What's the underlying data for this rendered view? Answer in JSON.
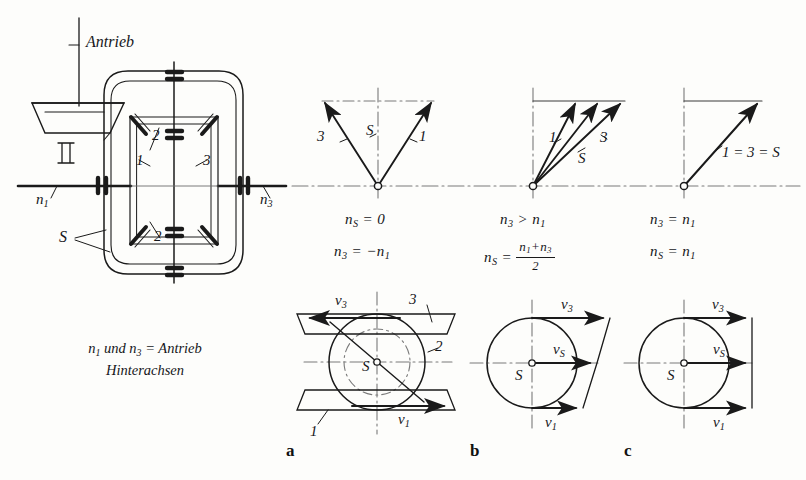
{
  "figure": {
    "type": "technical-diagram",
    "language": "de"
  },
  "mechanism": {
    "drive_label": "Antrieb",
    "input_shaft_speed_left": "n",
    "input_shaft_speed_left_sub": "1",
    "input_shaft_speed_right": "n",
    "input_shaft_speed_right_sub": "3",
    "cage_label": "S",
    "gear_labels": [
      "1",
      "2",
      "3",
      "2"
    ],
    "caption_line1_a": "n",
    "caption_line1_a_sub": "1",
    "caption_line1_b": "und",
    "caption_line1_c": "n",
    "caption_line1_c_sub": "3",
    "caption_line1_d": "= Antrieb",
    "caption_line2": "Hinterachsen"
  },
  "speed_diagrams": [
    {
      "id": "left",
      "vector_labels": [
        "3",
        "S",
        "1"
      ],
      "eq1_lhs": "n",
      "eq1_lhs_sub": "S",
      "eq1_rel": "=",
      "eq1_rhs": "0",
      "eq2_lhs": "n",
      "eq2_lhs_sub": "3",
      "eq2_rel": "=",
      "eq2_rhs": "−n",
      "eq2_rhs_sub": "1",
      "description": "Cage stationary, wheels counter-rotate"
    },
    {
      "id": "middle",
      "vector_labels": [
        "1",
        "S",
        "3"
      ],
      "eq1_lhs": "n",
      "eq1_lhs_sub": "3",
      "eq1_rel": ">",
      "eq1_rhs": "n",
      "eq1_rhs_sub": "1",
      "eq2_lhs": "n",
      "eq2_lhs_sub": "S",
      "eq2_rel": "=",
      "eq2_frac_num_a": "n",
      "eq2_frac_num_a_sub": "1",
      "eq2_frac_num_plus": "+",
      "eq2_frac_num_b": "n",
      "eq2_frac_num_b_sub": "3",
      "eq2_frac_den": "2",
      "description": "Unequal wheel speeds, cage speed is the mean"
    },
    {
      "id": "right",
      "vector_labels": [
        "1 = 3 = S"
      ],
      "eq1_lhs": "n",
      "eq1_lhs_sub": "3",
      "eq1_rel": "=",
      "eq1_rhs": "n",
      "eq1_rhs_sub": "1",
      "eq2_lhs": "n",
      "eq2_lhs_sub": "S",
      "eq2_rel": "=",
      "eq2_rhs": "n",
      "eq2_rhs_sub": "1",
      "description": "Straight running, all speeds equal"
    }
  ],
  "velocity_diagrams": [
    {
      "id": "a",
      "panel_letter": "a",
      "labels": {
        "v_top": "v",
        "v_top_sub": "3",
        "v_bottom": "v",
        "v_bottom_sub": "1",
        "center": "S",
        "plate_top": "3",
        "plate_bottom": "1",
        "inner_circle": "2"
      },
      "description": "Opposed velocities, cage at rest"
    },
    {
      "id": "b",
      "panel_letter": "b",
      "labels": {
        "v_top": "v",
        "v_top_sub": "3",
        "v_mid": "v",
        "v_mid_sub": "S",
        "v_bottom": "v",
        "v_bottom_sub": "1",
        "center": "S"
      },
      "description": "Velocities of different magnitude, same direction"
    },
    {
      "id": "c",
      "panel_letter": "c",
      "labels": {
        "v_top": "v",
        "v_top_sub": "3",
        "v_mid": "v",
        "v_mid_sub": "S",
        "v_bottom": "v",
        "v_bottom_sub": "1",
        "center": "S"
      },
      "description": "All velocities equal"
    }
  ],
  "colors": {
    "ink": "#1a1a1a",
    "paper": "#fdfdfb",
    "light_ink": "#5a5a5a"
  }
}
